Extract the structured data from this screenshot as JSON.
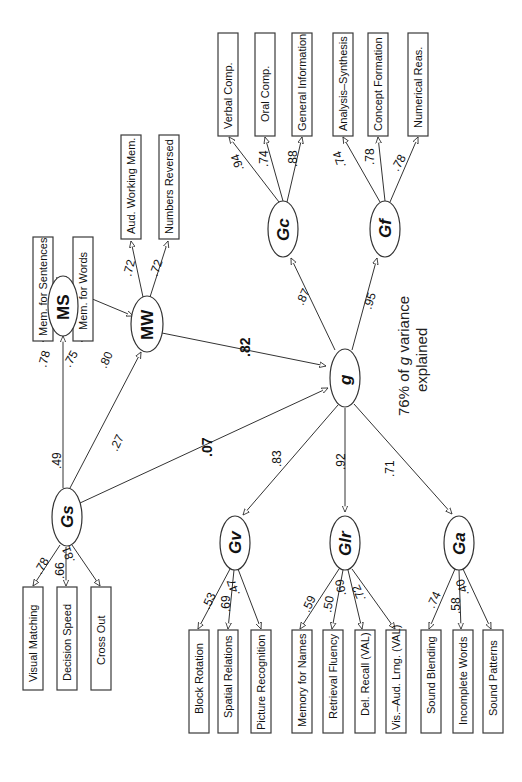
{
  "diagram": {
    "type": "structural-equation-model",
    "orientation": "rotated-90-ccw",
    "note": {
      "line1_prefix": "76% of ",
      "line1_g": "g",
      "line1_suffix": " variance",
      "line2": "explained"
    },
    "factors": {
      "g": "g",
      "Gc": "Gc",
      "Gf": "Gf",
      "Gs": "Gs",
      "MS": "MS",
      "MW": "MW",
      "Gv": "Gv",
      "Glr": "Glr",
      "Ga": "Ga"
    },
    "structural_paths": {
      "g_Gc": ".87",
      "g_Gf": ".95",
      "g_Gv": ".83",
      "g_Glr": ".92",
      "g_Ga": ".71",
      "MW_g": ".82",
      "Gs_g": ".07",
      "Gs_MS": ".49",
      "Gs_MW": ".27",
      "MS_MW": ".80"
    },
    "indicators": {
      "Gc": [
        {
          "label": "Verbal Comp.",
          "loading": ".94"
        },
        {
          "label": "Oral Comp.",
          "loading": ".74"
        },
        {
          "label": "General Information",
          "loading": ".88"
        }
      ],
      "Gf": [
        {
          "label": "Analysis–Synthesis",
          "loading": ".74"
        },
        {
          "label": "Concept Formation",
          "loading": ".78"
        },
        {
          "label": "Numerical Reas.",
          "loading": ".78"
        }
      ],
      "MS": [
        {
          "label": "Mem. for Sentences",
          "loading": ".78"
        },
        {
          "label": "Mem. for Words",
          "loading": ".75"
        }
      ],
      "MW": [
        {
          "label": "Aud. Working Mem.",
          "loading": ".72"
        },
        {
          "label": "Numbers Reversed",
          "loading": ".72"
        }
      ],
      "Gs": [
        {
          "label": "Visual Matching",
          "loading": ".78"
        },
        {
          "label": "Decision Speed",
          "loading": ".66"
        },
        {
          "label": "Cross Out",
          "loading": ".81"
        }
      ],
      "Gv": [
        {
          "label": "Block Rotation",
          "loading": ".53"
        },
        {
          "label": "Spatial Relations",
          "loading": ".69"
        },
        {
          "label": "Picture Recognition",
          "loading": ".47"
        }
      ],
      "Glr": [
        {
          "label": "Memory for Names",
          "loading": ".59"
        },
        {
          "label": "Retrieval Fluency",
          "loading": ".50"
        },
        {
          "label": "Del. Recall (VAL)",
          "loading": ".69"
        },
        {
          "label": "Vis.–Aud. Lrng. (VAL)",
          "loading": ".72"
        }
      ],
      "Ga": [
        {
          "label": "Sound Blending",
          "loading": ".74"
        },
        {
          "label": "Incomplete Words",
          "loading": ".58"
        },
        {
          "label": "Sound Patterns",
          "loading": ".40"
        }
      ]
    },
    "colors": {
      "line": "#333333",
      "background": "#ffffff",
      "text": "#111111"
    }
  }
}
